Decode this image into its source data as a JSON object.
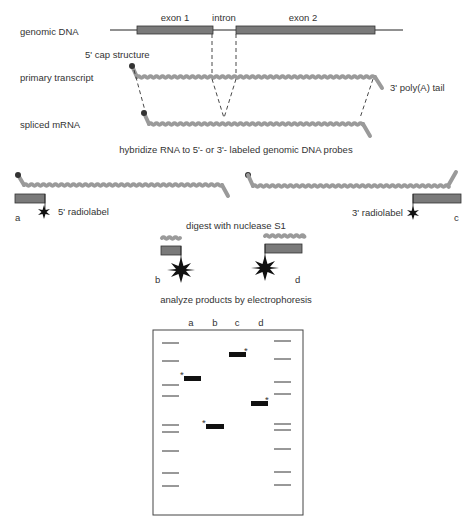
{
  "diagram": {
    "row_labels": {
      "genomic_dna": "genomic DNA",
      "primary_transcript": "primary transcript",
      "spliced_mrna": "spliced mRNA"
    },
    "gene_labels": {
      "exon1": "exon 1",
      "intron": "intron",
      "exon2": "exon 2"
    },
    "annotations": {
      "cap": "5' cap structure",
      "polya": "3' poly(A) tail",
      "radiolabel_5": "5' radiolabel",
      "radiolabel_3": "3' radiolabel"
    },
    "steps": {
      "hybridize": "hybridize RNA to 5'- or 3'- labeled genomic DNA probes",
      "digest": "digest with nuclease S1",
      "analyze": "analyze products by electrophoresis"
    },
    "probe_labels": {
      "a": "a",
      "b": "b",
      "c": "c",
      "d": "d"
    },
    "gel": {
      "lanes": [
        "a",
        "b",
        "c",
        "d"
      ],
      "band_marker": "*",
      "bands": [
        {
          "lane": "a",
          "y": 378
        },
        {
          "lane": "b",
          "y": 426
        },
        {
          "lane": "c",
          "y": 354
        },
        {
          "lane": "d",
          "y": 403
        }
      ],
      "left_ladder_y": [
        343,
        361,
        385,
        396,
        425,
        432,
        451,
        473,
        486
      ],
      "right_ladder_y": [
        341,
        359,
        382,
        394,
        424,
        430,
        449,
        472,
        485
      ]
    },
    "colors": {
      "exon": "#7a7a7a",
      "rna": "#9a9a9a",
      "band": "#111111"
    }
  }
}
